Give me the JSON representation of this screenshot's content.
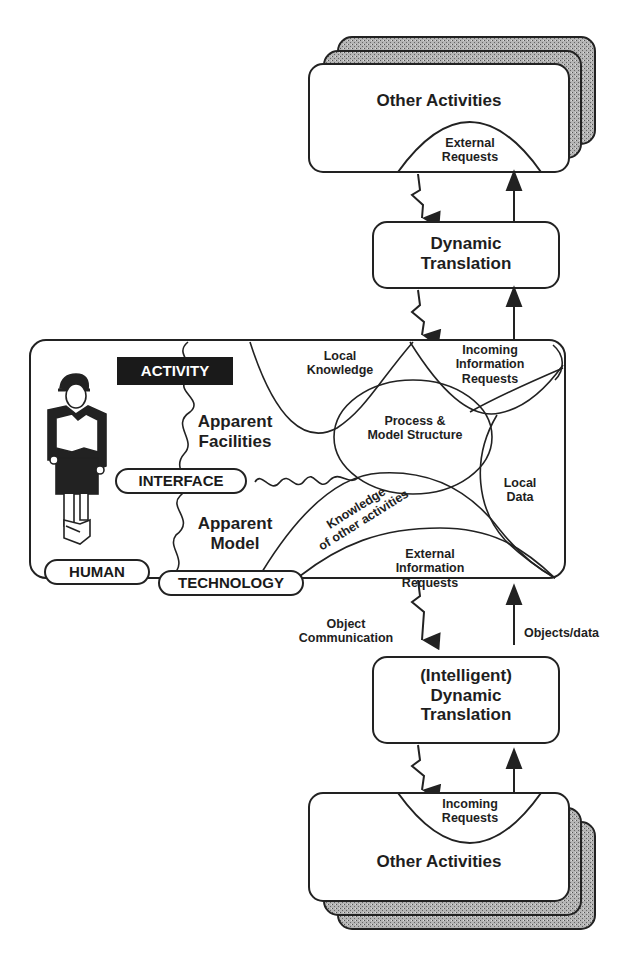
{
  "colors": {
    "ink": "#222222",
    "paper": "#ffffff",
    "stipple": "#9a9a9a",
    "activity_bg": "#1a1a1a"
  },
  "top_stack": {
    "title": "Other Activities",
    "region": [
      "External",
      "Requests"
    ]
  },
  "top_translation": {
    "lines": [
      "Dynamic",
      "Translation"
    ]
  },
  "activity": {
    "badge": "ACTIVITY",
    "apparent_facilities": [
      "Apparent",
      "Facilities"
    ],
    "apparent_model": [
      "Apparent",
      "Model"
    ],
    "interface_label": "INTERFACE",
    "human_label": "HUMAN",
    "technology_label": "TECHNOLOGY",
    "local_knowledge": [
      "Local",
      "Knowledge"
    ],
    "incoming_info": [
      "Incoming",
      "Information",
      "Requests"
    ],
    "process_model": [
      "Process &",
      "Model Structure"
    ],
    "local_data": [
      "Local",
      "Data"
    ],
    "knowledge_other": [
      "Knowledge",
      "of other activities"
    ],
    "external_info": [
      "External",
      "Information",
      "Requests"
    ]
  },
  "arrows": {
    "object_communication": [
      "Object",
      "Communication"
    ],
    "objects_data": "Objects/data"
  },
  "bottom_translation": {
    "lines": [
      "(Intelligent)",
      "Dynamic",
      "Translation"
    ]
  },
  "bottom_stack": {
    "title": "Other Activities",
    "region": [
      "Incoming",
      "Requests"
    ]
  }
}
